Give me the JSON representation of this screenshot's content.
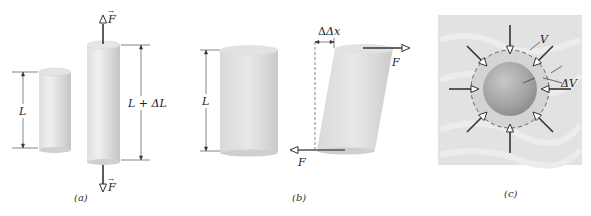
{
  "figure": {
    "panels": [
      {
        "id": "a",
        "caption": "(a)",
        "description": "Tension: cylinder of length L stretched to L + ΔL by opposing forces",
        "labels": {
          "original_length": "L",
          "stretched_length": "L + ΔL",
          "force_top": "F",
          "force_bottom": "F"
        }
      },
      {
        "id": "b",
        "caption": "(b)",
        "description": "Shearing: cylinder of length L sheared by Δx under opposing tangential forces",
        "labels": {
          "length": "L",
          "displacement": "Δx",
          "force_top": "F",
          "force_bottom": "F"
        }
      },
      {
        "id": "c",
        "caption": "(c)",
        "description": "Hydraulic stress: sphere of volume V compressed by ΔV by uniform fluid pressure",
        "labels": {
          "volume": "V",
          "volume_change": "ΔV"
        }
      }
    ],
    "colors": {
      "cylinder_light": "#ececec",
      "cylinder_mid": "#d4d4d4",
      "cylinder_dark": "#bdbdbd",
      "arrow": "#3a3a3a",
      "fluid_bg": "#e2e2e2",
      "sphere": "#a8a8a8",
      "shell": "#cfcfcf"
    }
  }
}
